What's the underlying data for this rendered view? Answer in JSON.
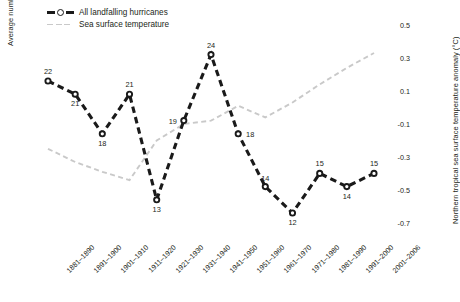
{
  "chart_data": {
    "type": "line",
    "title": "",
    "xlabel": "",
    "categories": [
      "1881–1890",
      "1891–1900",
      "1901–1910",
      "1911–1920",
      "1921–1930",
      "1931–1940",
      "1941–1950",
      "1951–1960",
      "1961–1970",
      "1971–1980",
      "1981–1990",
      "1991–2000",
      "2001–2006"
    ],
    "series": [
      {
        "name": "All landfalling hurricanes",
        "axis": "left",
        "color": "#1a1a1a",
        "style": "dashed",
        "marker": "open-circle",
        "values": [
          22,
          21,
          18,
          21,
          13,
          19,
          24,
          18,
          14,
          12,
          15,
          14,
          15
        ],
        "data_labels": [
          "22",
          "21",
          "18",
          "21",
          "13",
          "19",
          "24",
          "18",
          "14",
          "12",
          "15",
          "14",
          "15"
        ]
      },
      {
        "name": "Sea surface temperature",
        "axis": "right",
        "color": "#c9c9c9",
        "style": "dashed",
        "marker": "none",
        "values": [
          -0.25,
          -0.33,
          -0.39,
          -0.44,
          -0.2,
          -0.1,
          -0.08,
          0.01,
          -0.06,
          0.03,
          0.14,
          0.24,
          0.33
        ]
      }
    ],
    "left_axis": {
      "label": "Average number of hurricanes per year",
      "ticks": [],
      "ylim": [
        10,
        26
      ],
      "grid": false
    },
    "right_axis": {
      "label": "Northern tropical sea surface temperature anomaly (°C)",
      "ticks": [
        "0.5",
        "0.3",
        "0.1",
        "-0.1",
        "-0.3",
        "-0.5",
        "-0.7"
      ],
      "ylim": [
        -0.7,
        0.5
      ],
      "grid": false
    },
    "legend": {
      "position": "top-left",
      "entries": [
        {
          "label": "All landfalling hurricanes",
          "color": "#1a1a1a"
        },
        {
          "label": "Sea surface temperature",
          "color": "#c9c9c9"
        }
      ]
    }
  }
}
